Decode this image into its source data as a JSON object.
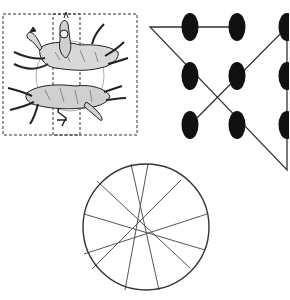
{
  "figure": {
    "colors": {
      "ink": "#111111",
      "line": "#333333",
      "chord": "#555555",
      "background": "#ffffff"
    }
  },
  "horse_puzzle": {
    "label": "horse-and-rider puzzle (two horses, rider strip)",
    "outer_frame": {
      "x": 3,
      "y": 14,
      "w": 134,
      "h": 121
    },
    "rider_strip": {
      "x": 53,
      "y": 14,
      "w": 27,
      "h": 121
    }
  },
  "nine_dot_puzzle": {
    "label": "nine-dot puzzle solution",
    "dots": [
      {
        "x": 190,
        "y": 27
      },
      {
        "x": 237,
        "y": 27
      },
      {
        "x": 287,
        "y": 27
      },
      {
        "x": 190,
        "y": 76
      },
      {
        "x": 237,
        "y": 76
      },
      {
        "x": 287,
        "y": 76
      },
      {
        "x": 190,
        "y": 125
      },
      {
        "x": 237,
        "y": 125
      },
      {
        "x": 287,
        "y": 125
      }
    ],
    "path": [
      [
        237,
        27
      ],
      [
        150,
        27
      ],
      [
        287,
        170
      ],
      [
        287,
        27
      ],
      [
        190,
        125
      ]
    ]
  },
  "chord_circle": {
    "label": "circle with six chords",
    "center": {
      "x": 146,
      "y": 227
    },
    "radius": 63,
    "chords": [
      [
        131,
        164,
        159,
        290
      ],
      [
        148,
        164,
        125,
        290
      ],
      [
        97,
        181,
        190,
        268
      ],
      [
        181,
        180,
        92,
        269
      ],
      [
        84,
        214,
        205,
        250
      ],
      [
        207,
        214,
        84,
        254
      ]
    ]
  }
}
